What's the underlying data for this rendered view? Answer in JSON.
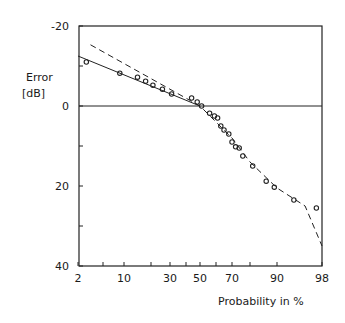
{
  "chart_data": {
    "type": "line",
    "title": "",
    "xlabel": "Probability in %",
    "ylabel": "Error [dB]",
    "ylabel_lines": [
      "Error",
      "[dB]"
    ],
    "x_scale": "normal-probability",
    "x_ticks": [
      2,
      5,
      10,
      20,
      30,
      40,
      50,
      60,
      70,
      80,
      90,
      98
    ],
    "x_tick_labels": [
      "2",
      "10",
      "30",
      "50",
      "70",
      "90",
      "98"
    ],
    "x_tick_labeled_values": [
      2,
      10,
      30,
      50,
      70,
      90,
      98
    ],
    "y_ticks": [
      -20,
      -10,
      0,
      10,
      20,
      30,
      40
    ],
    "y_tick_labels": [
      "-20",
      "0",
      "20",
      "40"
    ],
    "y_tick_labeled_values": [
      -20,
      0,
      20,
      40
    ],
    "ylim": [
      -20,
      40
    ],
    "y_inverted": true,
    "xlim": [
      2,
      98
    ],
    "grid": false,
    "zero_line": true,
    "series": [
      {
        "name": "measured",
        "style": "markers-open-circle",
        "points": [
          [
            3,
            -11
          ],
          [
            9,
            -8.2
          ],
          [
            15,
            -7.2
          ],
          [
            18,
            -6.2
          ],
          [
            21,
            -5.2
          ],
          [
            26,
            -4.2
          ],
          [
            31,
            -3
          ],
          [
            44,
            -2
          ],
          [
            48,
            -1
          ],
          [
            51,
            0
          ],
          [
            56,
            1.8
          ],
          [
            59,
            2.5
          ],
          [
            61,
            3
          ],
          [
            63,
            5
          ],
          [
            65,
            6
          ],
          [
            68,
            7
          ],
          [
            70,
            9
          ],
          [
            72,
            10.2
          ],
          [
            74,
            10.5
          ],
          [
            76,
            12.5
          ],
          [
            81,
            15
          ],
          [
            86,
            18.8
          ],
          [
            89,
            20.3
          ],
          [
            93,
            23.5
          ],
          [
            97,
            25.5
          ]
        ]
      },
      {
        "name": "solid-fit",
        "style": "solid",
        "points": [
          [
            2,
            -12.5
          ],
          [
            50,
            0
          ]
        ]
      },
      {
        "name": "dashed-fit",
        "style": "dashed",
        "points": [
          [
            3.5,
            -15.3
          ],
          [
            50,
            0
          ],
          [
            70,
            8
          ],
          [
            80,
            14
          ],
          [
            90,
            20.5
          ],
          [
            95,
            25
          ],
          [
            98,
            35
          ]
        ]
      }
    ],
    "legend": null
  },
  "labels": {
    "y_title_line1": "Error",
    "y_title_line2": "[dB]",
    "x_title": "Probability in %",
    "x_ticks": [
      "2",
      "10",
      "30",
      "50",
      "70",
      "90",
      "98"
    ],
    "y_ticks": [
      "-20",
      "0",
      "20",
      "40"
    ]
  }
}
